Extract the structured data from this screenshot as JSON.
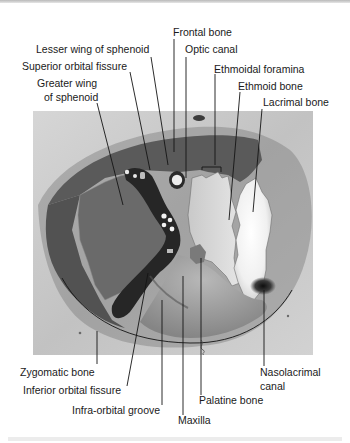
{
  "figure": {
    "colors": {
      "background": "#ffffff",
      "face_surface": "#c9c9c9",
      "orbit_roof": "#5a5a5a",
      "greater_wing": "#6b6b6b",
      "zygomatic_orbital": "#555555",
      "fissure_dark": "#262626",
      "ethmoid": "#d8d8d8",
      "lacrimal": "#f2f2f2",
      "maxilla_floor": "#9a9a9a",
      "label_text": "#1a1a1a"
    },
    "labels": {
      "top": [
        {
          "id": "frontal-bone",
          "lines": [
            "Frontal bone"
          ]
        },
        {
          "id": "lesser-wing-of-sphenoid",
          "lines": [
            "Lesser wing of sphenoid"
          ]
        },
        {
          "id": "optic-canal",
          "lines": [
            "Optic canal"
          ]
        },
        {
          "id": "superior-orbital-fissure",
          "lines": [
            "Superior orbital fissure"
          ]
        },
        {
          "id": "ethmoidal-foramina",
          "lines": [
            "Ethmoidal foramina"
          ]
        },
        {
          "id": "greater-wing-of-sphenoid",
          "lines": [
            "Greater wing",
            "of sphenoid"
          ]
        },
        {
          "id": "ethmoid-bone",
          "lines": [
            "Ethmoid bone"
          ]
        },
        {
          "id": "lacrimal-bone",
          "lines": [
            "Lacrimal bone"
          ]
        }
      ],
      "bottom": [
        {
          "id": "zygomatic-bone",
          "lines": [
            "Zygomatic bone"
          ]
        },
        {
          "id": "inferior-orbital-fissure",
          "lines": [
            "Inferior orbital fissure"
          ]
        },
        {
          "id": "infra-orbital-groove",
          "lines": [
            "Infra-orbital groove"
          ]
        },
        {
          "id": "maxilla",
          "lines": [
            "Maxilla"
          ]
        },
        {
          "id": "palatine-bone",
          "lines": [
            "Palatine bone"
          ]
        },
        {
          "id": "nasolacrimal-canal",
          "lines": [
            "Nasolacrimal",
            "canal"
          ]
        }
      ]
    }
  }
}
